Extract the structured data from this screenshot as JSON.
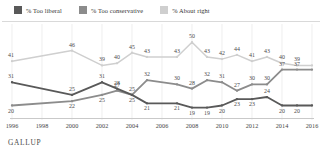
{
  "legend": {
    "items": [
      {
        "label": "% Too liberal",
        "color": "#595959",
        "name": "legend-too-liberal"
      },
      {
        "label": "% Too conservative",
        "color": "#8c8c8c",
        "name": "legend-too-conservative"
      },
      {
        "label": "% About right",
        "color": "#cfcfcf",
        "name": "legend-about-right"
      }
    ]
  },
  "source": {
    "label": "GALLUP"
  },
  "chart_data": {
    "type": "line",
    "title": "",
    "xlabel": "",
    "ylabel": "",
    "x": [
      1996,
      1998,
      2000,
      2001,
      2002,
      2003,
      2004,
      2005,
      2007,
      2008,
      2009,
      2010,
      2011,
      2012,
      2013,
      2014,
      2015,
      2016
    ],
    "tick_labels": [
      "1996",
      "1998",
      "2000",
      "2002",
      "2004",
      "2006",
      "2008",
      "2010",
      "2012",
      "2014",
      "2016"
    ],
    "xlim": [
      1996,
      2016
    ],
    "ylim": [
      15,
      52
    ],
    "grid": true,
    "legend_position": "top-left",
    "series": [
      {
        "name": "% About right",
        "color": "#cfcfcf",
        "x": [
          1996,
          2000,
          2002,
          2003,
          2004,
          2005,
          2007,
          2008,
          2009,
          2010,
          2011,
          2012,
          2013,
          2014,
          2015,
          2016
        ],
        "values": [
          41,
          46,
          39,
          40,
          45,
          43,
          43,
          50,
          43,
          42,
          44,
          41,
          43,
          40,
          39,
          39
        ],
        "labels": [
          "41",
          "46",
          "39",
          "40",
          "45",
          "43",
          "43",
          "50",
          "43",
          "42",
          "44",
          "41",
          "43",
          "40",
          "39",
          ""
        ]
      },
      {
        "name": "% Too liberal",
        "color": "#595959",
        "x": [
          1996,
          2000,
          2002,
          2003,
          2004,
          2005,
          2007,
          2008,
          2009,
          2010,
          2011,
          2012,
          2013,
          2014,
          2015,
          2016
        ],
        "values": [
          31,
          25,
          31,
          28,
          25,
          21,
          21,
          19,
          19,
          20,
          23,
          23,
          24,
          20,
          20,
          20
        ],
        "labels": [
          "31",
          "25",
          "31",
          "28",
          "25",
          "21",
          "21",
          "19",
          "19",
          "20",
          "23",
          "23",
          "24",
          "20",
          "20",
          ""
        ]
      },
      {
        "name": "% Too conservative",
        "color": "#8c8c8c",
        "x": [
          1996,
          2000,
          2002,
          2003,
          2004,
          2005,
          2007,
          2008,
          2009,
          2010,
          2011,
          2012,
          2013,
          2014,
          2015,
          2016
        ],
        "values": [
          20,
          22,
          25,
          27,
          25,
          32,
          30,
          28,
          32,
          31,
          27,
          30,
          30,
          37,
          37,
          37
        ],
        "labels": [
          "20",
          "22",
          "25",
          "27",
          "25",
          "32",
          "30",
          "28",
          "32",
          "31",
          "27",
          "30",
          "30",
          "37",
          "37",
          ""
        ]
      }
    ]
  }
}
